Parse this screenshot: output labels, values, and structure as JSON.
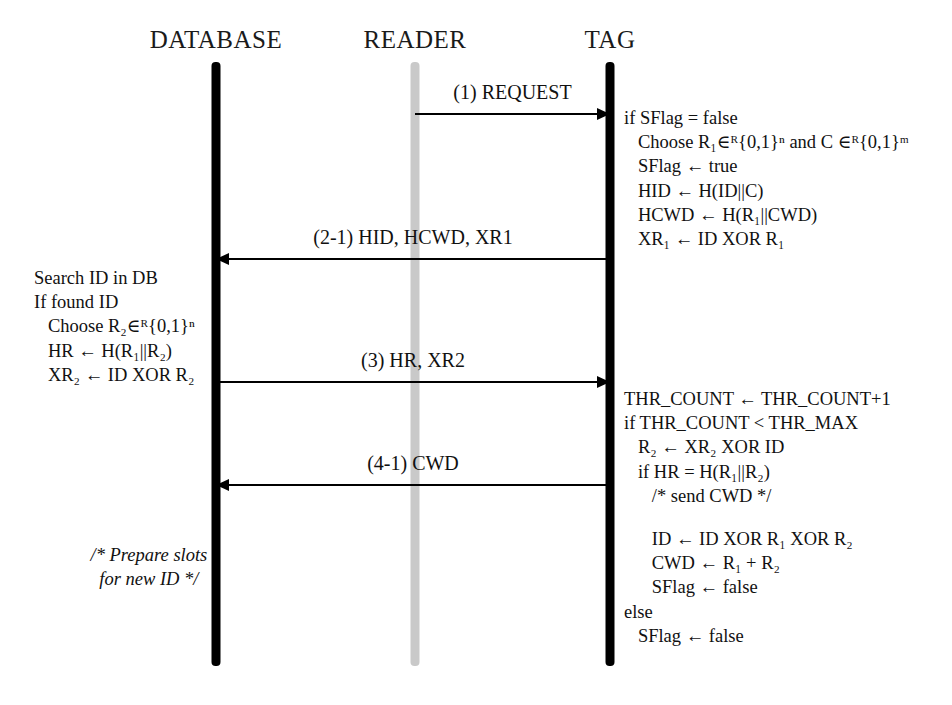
{
  "diagram": {
    "colors": {
      "lifeline_dark": "#000000",
      "lifeline_light": "#c9c9c9",
      "arrow": "#000000",
      "text": "#111111",
      "background": "#ffffff"
    }
  },
  "actors": [
    {
      "id": "database",
      "label": "DATABASE",
      "x": 216,
      "lifeline_color": "#000000"
    },
    {
      "id": "reader",
      "label": "READER",
      "x": 415,
      "lifeline_color": "#c9c9c9"
    },
    {
      "id": "tag",
      "label": "TAG",
      "x": 610,
      "lifeline_color": "#000000"
    }
  ],
  "messages": [
    {
      "id": "m1",
      "label": "(1) REQUEST",
      "from": "reader",
      "to": "tag",
      "direction": "right",
      "y": 113
    },
    {
      "id": "m2",
      "label": "(2-1) HID, HCWD, XR1",
      "from": "tag",
      "to": "database",
      "direction": "left",
      "y": 258
    },
    {
      "id": "m3",
      "label": "(3) HR, XR2",
      "from": "database",
      "to": "tag",
      "direction": "right",
      "y": 381
    },
    {
      "id": "m4",
      "label": "(4-1) CWD",
      "from": "tag",
      "to": "database",
      "direction": "left",
      "y": 484
    }
  ],
  "code_blocks": {
    "tag_top": {
      "owner": "tag",
      "lines": [
        "if SFlag = false",
        "   Choose R₁∈ᴿ{0,1}ⁿ and C ∈ᴿ{0,1}ᵐ",
        "   SFlag ← true",
        "   HID ← H(ID||C)",
        "   HCWD ← H(R₁||CWD)",
        "   XR₁ ← ID XOR R₁"
      ]
    },
    "database_main": {
      "owner": "database",
      "lines": [
        "Search ID in DB",
        "If found ID",
        "   Choose R₂∈ᴿ{0,1}ⁿ",
        "   HR ← H(R₁||R₂)",
        "   XR₂ ← ID XOR R₂"
      ]
    },
    "tag_verify": {
      "owner": "tag",
      "lines": [
        "THR_COUNT ← THR_COUNT+1",
        "if THR_COUNT < THR_MAX",
        "   R₂ ← XR₂ XOR ID",
        "   if HR = H(R₁||R₂)",
        "      /* send CWD */"
      ]
    },
    "tag_update": {
      "owner": "tag",
      "lines": [
        "      ID ← ID XOR R₁ XOR R₂",
        "      CWD ← R₁ + R₂",
        "      SFlag ← false",
        "else",
        "   SFlag ← false"
      ]
    },
    "database_note": {
      "owner": "database",
      "lines": [
        "/* Prepare slots",
        "for new ID */"
      ]
    }
  }
}
